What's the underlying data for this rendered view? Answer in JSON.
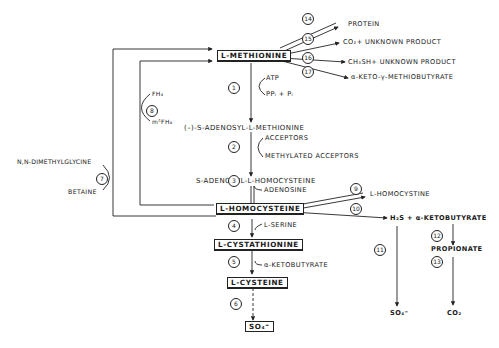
{
  "diagram": {
    "nodes": {
      "methionine": "L-METHIONINE",
      "sam": "(–)-S-ADENOSYL-L-METHIONINE",
      "sah": "S-ADENOSYL-L-HOMOCYSTEINE",
      "homocysteine": "L-HOMOCYSTEINE",
      "cystathionine": "L-CYSTATHIONINE",
      "cysteine": "L-CYSTEINE",
      "sulfate_box": "SO₄⁼",
      "homocystine": "L-HOMOCYSTINE",
      "h2s_keto": "H₂S + α-KETOBUTYRATE",
      "propionate": "PROPIONATE",
      "sulfate": "SO₄⁼",
      "co2": "CO₂"
    },
    "methionine_products": {
      "protein": "PROTEIN",
      "co2_unknown": "CO₂+ UNKNOWN PRODUCT",
      "ch3sh_unknown": "CH₃SH+ UNKNOWN PRODUCT",
      "keto_methiobutyrate": "α-KETO-γ-METHIOBUTYRATE"
    },
    "cofactors": {
      "atp": "ATP",
      "ppi_pi": "PPᵢ + Pᵢ",
      "acceptors": "ACCEPTORS",
      "methylated_acceptors": "METHYLATED ACCEPTORS",
      "adenosine": "ADENOSINE",
      "serine": "L-SERINE",
      "ketobutyrate": "α-KETOBUTYRATE",
      "fh4": "FH₄",
      "m5fh4": "m⁵FH₄",
      "dimethylglycine": "N,N-DIMETHYLGLYCINE",
      "betaine": "BETAINE"
    },
    "steps": [
      "1",
      "2",
      "3",
      "4",
      "5",
      "6",
      "7",
      "8",
      "9",
      "10",
      "11",
      "12",
      "13",
      "14",
      "15",
      "16",
      "17"
    ]
  }
}
